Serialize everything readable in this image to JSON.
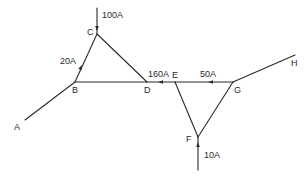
{
  "diagram": {
    "type": "current network",
    "nodes": [
      {
        "id": "A",
        "label": "A",
        "x": 25,
        "y": 120,
        "lx": 14,
        "ly": 130
      },
      {
        "id": "B",
        "label": "B",
        "x": 75,
        "y": 82,
        "lx": 72,
        "ly": 93
      },
      {
        "id": "C",
        "label": "C",
        "x": 97,
        "y": 34,
        "lx": 87,
        "ly": 35
      },
      {
        "id": "D",
        "label": "D",
        "x": 147,
        "y": 82,
        "lx": 144,
        "ly": 93
      },
      {
        "id": "E",
        "label": "E",
        "x": 175,
        "y": 82,
        "lx": 172,
        "ly": 78
      },
      {
        "id": "F",
        "label": "F",
        "x": 198,
        "y": 137,
        "lx": 186,
        "ly": 142
      },
      {
        "id": "G",
        "label": "G",
        "x": 233,
        "y": 82,
        "lx": 234,
        "ly": 93
      },
      {
        "id": "H",
        "label": "H",
        "x": 295,
        "y": 55,
        "lx": 291,
        "ly": 66
      }
    ],
    "edges": [
      {
        "from": "A",
        "to": "B"
      },
      {
        "from": "B",
        "to": "C"
      },
      {
        "from": "C",
        "to": "D"
      },
      {
        "from": "B",
        "to": "D"
      },
      {
        "from": "D",
        "to": "E"
      },
      {
        "from": "E",
        "to": "G"
      },
      {
        "from": "E",
        "to": "F"
      },
      {
        "from": "F",
        "to": "G"
      },
      {
        "from": "G",
        "to": "H"
      }
    ],
    "currents": [
      {
        "id": "i-100",
        "label": "100A",
        "description": "external current entering node C from above",
        "line": [
          97,
          8,
          97,
          34
        ],
        "arrow": {
          "x": 97,
          "y": 31,
          "dir": "down"
        },
        "lx": 102,
        "ly": 18
      },
      {
        "id": "i-20",
        "label": "20A",
        "description": "current on branch B-C flowing toward C",
        "arrow": {
          "x": 82,
          "y": 65,
          "dir": "up-bc"
        },
        "lx": 60,
        "ly": 64
      },
      {
        "id": "i-160",
        "label": "160A",
        "description": "current on branch D-E flowing toward D",
        "arrow": {
          "x": 158,
          "y": 82,
          "dir": "left"
        },
        "lx": 148,
        "ly": 77
      },
      {
        "id": "i-50",
        "label": "50A",
        "description": "current on branch E-G flowing toward E",
        "arrow": {
          "x": 208,
          "y": 82,
          "dir": "left"
        },
        "lx": 200,
        "ly": 77
      },
      {
        "id": "i-10",
        "label": "10A",
        "description": "external current entering node F from below",
        "line": [
          198,
          170,
          198,
          137
        ],
        "arrow": {
          "x": 198,
          "y": 142,
          "dir": "up"
        },
        "lx": 204,
        "ly": 158
      }
    ]
  }
}
